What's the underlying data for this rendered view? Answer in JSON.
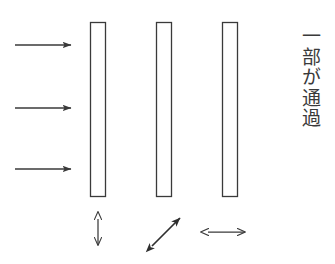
{
  "figure": {
    "title": "",
    "background_color": "#ffffff",
    "stroke_color": "#3a3a3a",
    "caption_vertical": "一部が通過",
    "caption_reading": "ichibu ga tsuuka"
  },
  "incident_arrows": {
    "count": 3,
    "direction": "right",
    "items": [
      {
        "label": "incident-beam-top",
        "x_start": 15,
        "x_end": 71,
        "y": 45
      },
      {
        "label": "incident-beam-middle",
        "x_start": 15,
        "x_end": 71,
        "y": 108
      },
      {
        "label": "incident-beam-bottom",
        "x_start": 15,
        "x_end": 71,
        "y": 169
      }
    ]
  },
  "plates": [
    {
      "name": "polarizer-1",
      "x": 90,
      "y": 22,
      "width": 16,
      "height": 175,
      "fill": "#ffffff"
    },
    {
      "name": "polarizer-2",
      "x": 156,
      "y": 22,
      "width": 16,
      "height": 175,
      "fill": "#ffffff"
    },
    {
      "name": "polarizer-3",
      "x": 222,
      "y": 22,
      "width": 16,
      "height": 175,
      "fill": "#ffffff"
    }
  ],
  "axis_symbols": [
    {
      "name": "polarization-axis-vertical",
      "glyph": "up-down-arrow",
      "center_x": 98,
      "center_y": 232,
      "angle_deg": 90
    },
    {
      "name": "polarization-axis-diagonal",
      "glyph": "diagonal-double-arrow",
      "center_x": 166,
      "center_y": 232,
      "angle_deg": 45
    },
    {
      "name": "polarization-axis-horizontal",
      "glyph": "left-right-arrow",
      "center_x": 225,
      "center_y": 232,
      "angle_deg": 0
    }
  ]
}
